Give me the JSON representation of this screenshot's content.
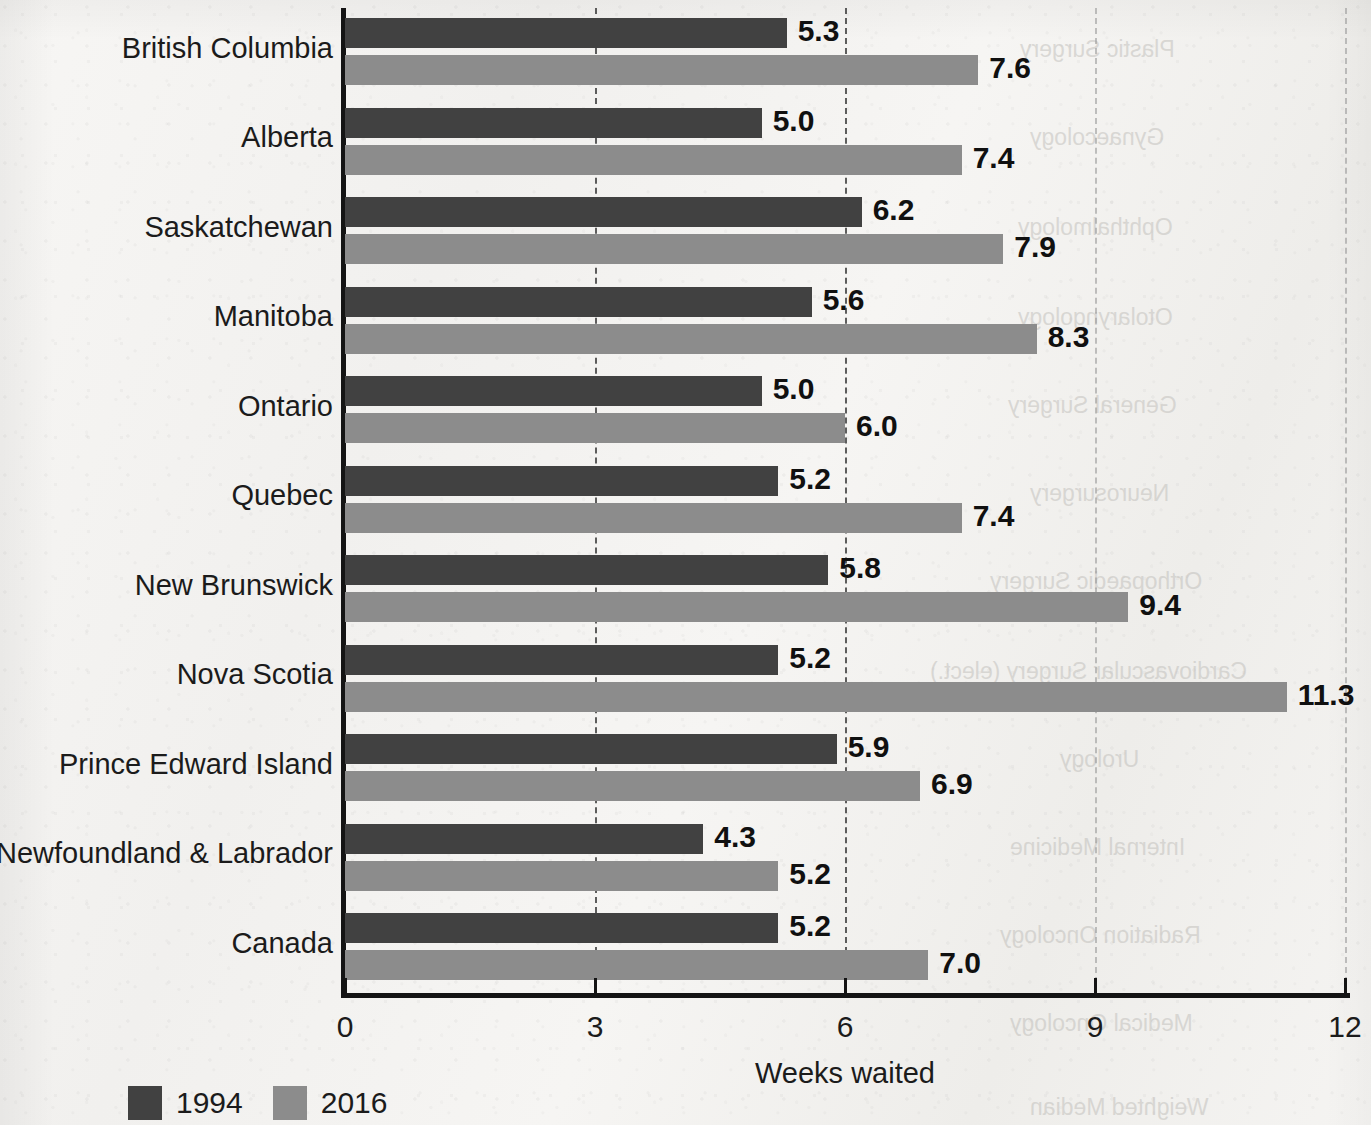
{
  "chart_data": {
    "type": "bar",
    "orientation": "horizontal",
    "title": "",
    "xlabel": "Weeks waited",
    "ylabel": "",
    "xlim": [
      0,
      12
    ],
    "xticks": [
      "0",
      "3",
      "6",
      "9",
      "12"
    ],
    "xtick_values": [
      0,
      3,
      6,
      9,
      12
    ],
    "grid": "vertical dashed gridlines at 3, 6, 9, 12",
    "legend_position": "bottom-left",
    "categories": [
      "British Columbia",
      "Alberta",
      "Saskatchewan",
      "Manitoba",
      "Ontario",
      "Quebec",
      "New Brunswick",
      "Nova Scotia",
      "Prince Edward Island",
      "Newfoundland & Labrador",
      "Canada"
    ],
    "series": [
      {
        "name": "1994",
        "color": "#414141",
        "values": [
          5.3,
          5.0,
          6.2,
          5.6,
          5.0,
          5.2,
          5.8,
          5.2,
          5.9,
          4.3,
          5.2
        ],
        "labels": [
          "5.3",
          "5.0",
          "6.2",
          "5.6",
          "5.0",
          "5.2",
          "5.8",
          "5.2",
          "5.9",
          "4.3",
          "5.2"
        ]
      },
      {
        "name": "2016",
        "color": "#8c8c8c",
        "values": [
          7.6,
          7.4,
          7.9,
          8.3,
          6.0,
          7.4,
          9.4,
          11.3,
          6.9,
          5.2,
          7.0
        ],
        "labels": [
          "7.6",
          "7.4",
          "7.9",
          "8.3",
          "6.0",
          "7.4",
          "9.4",
          "11.3",
          "6.9",
          "5.2",
          "7.0"
        ]
      }
    ]
  },
  "legend": {
    "items": [
      {
        "label": "1994",
        "color": "#414141"
      },
      {
        "label": "2016",
        "color": "#8c8c8c"
      }
    ]
  },
  "axis": {
    "x_title": "Weeks waited"
  },
  "ghost_text": [
    "Plastic Surgery",
    "Gynaecology",
    "Ophthalmology",
    "Otolaryngology",
    "General Surgery",
    "Neurosurgery",
    "Orthopaedic Surgery",
    "Cardiovascular Surgery (elect.)",
    "Urology",
    "Internal Medicine",
    "Radiation Oncology",
    "Medical Oncology",
    "Weighted Median"
  ]
}
